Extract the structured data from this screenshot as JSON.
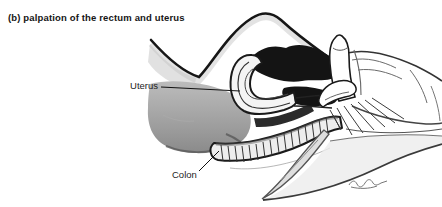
{
  "figure": {
    "caption": "(b) palpation of the rectum and uterus",
    "labels": {
      "uterus": "Uterus",
      "colon": "Colon"
    }
  },
  "colors": {
    "background": "#ffffff",
    "ink": "#1a1a1a",
    "text": "#151515",
    "tissue_gray": "#a2a2a2",
    "shadow_black": "#141414",
    "light_gray": "#ececec"
  }
}
